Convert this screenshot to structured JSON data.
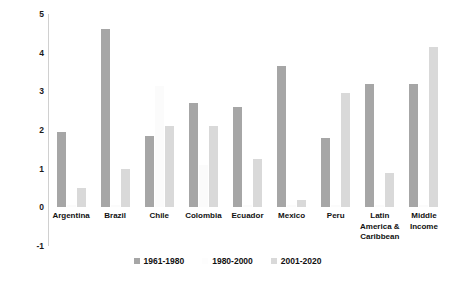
{
  "chart_data": {
    "type": "bar",
    "title": "",
    "subtitle": "",
    "xlabel": "",
    "ylabel": "Average GDP Growth (Percent)",
    "ylim": [
      -1,
      5
    ],
    "yticks": [
      5,
      4,
      3,
      2,
      1,
      0,
      -1
    ],
    "grid": false,
    "legend_position": "bottom",
    "categories": [
      "Argentina",
      "Brazil",
      "Chile",
      "Colombia",
      "Ecuador",
      "Mexico",
      "Peru",
      "Latin America & Caribbean",
      "Middle Income"
    ],
    "category_lines": [
      [
        "Argentina"
      ],
      [
        "Brazil"
      ],
      [
        "Chile"
      ],
      [
        "Colombia"
      ],
      [
        "Ecuador"
      ],
      [
        "Mexico"
      ],
      [
        "Peru"
      ],
      [
        "Latin",
        "America &",
        "Caribbean"
      ],
      [
        "Middle",
        "Income"
      ]
    ],
    "series": [
      {
        "name": "1961-1980",
        "color": "#a6a6a6",
        "values": [
          1.95,
          4.6,
          1.85,
          2.7,
          2.6,
          3.65,
          1.8,
          3.2,
          3.2
        ]
      },
      {
        "name": "1980-2000",
        "color": "#fdfdfd",
        "values": [
          0.05,
          0.05,
          3.15,
          1.1,
          0.05,
          0.05,
          0.05,
          0.05,
          0.05
        ]
      },
      {
        "name": "2001-2020",
        "color": "#d9d9d9",
        "values": [
          0.5,
          1.0,
          2.1,
          2.1,
          1.25,
          0.2,
          2.95,
          0.9,
          4.15
        ]
      }
    ]
  },
  "axis": {
    "y_title": "Average GDP Growth (Percent)"
  }
}
